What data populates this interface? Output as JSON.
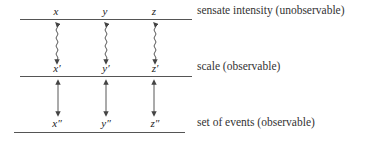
{
  "levels": [
    {
      "label": "sensate intensity (unobservable)",
      "vars": [
        "x",
        "y",
        "z"
      ]
    },
    {
      "label": "scale (observable)",
      "vars": [
        "x′",
        "y′",
        "z′"
      ]
    },
    {
      "label": "set of events (observable)",
      "vars": [
        "x″",
        "y″",
        "z″"
      ]
    }
  ],
  "connections": [
    {
      "from_level": 0,
      "to_level": 1,
      "style": "wavy-double-arrow"
    },
    {
      "from_level": 1,
      "to_level": 2,
      "style": "straight-double-arrow"
    }
  ]
}
